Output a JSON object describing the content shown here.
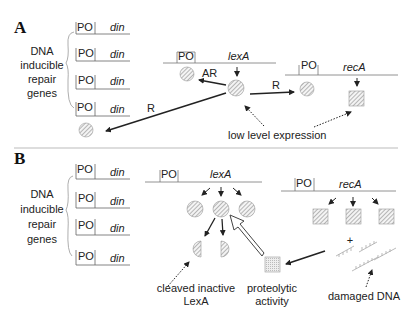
{
  "panel_a": {
    "letter": "A",
    "group_label": [
      "DNA",
      "inducible",
      "repair",
      "genes"
    ],
    "genes": [
      {
        "promoter": "PO",
        "name": "din"
      },
      {
        "promoter": "PO",
        "name": "din"
      },
      {
        "promoter": "PO",
        "name": "din"
      },
      {
        "promoter": "PO",
        "name": "din"
      }
    ],
    "lexA_gene": {
      "promoter": "PO",
      "name": "lexA"
    },
    "recA_gene": {
      "promoter": "PO",
      "name": "recA"
    },
    "autoregulation_label": "AR",
    "repression_label_left": "R",
    "repression_label_right": "R",
    "low_expression_label": "low level expression"
  },
  "panel_b": {
    "letter": "B",
    "group_label": [
      "DNA",
      "inducible",
      "repair",
      "genes"
    ],
    "genes": [
      {
        "promoter": "PO",
        "name": "din"
      },
      {
        "promoter": "PO",
        "name": "din"
      },
      {
        "promoter": "PO",
        "name": "din"
      },
      {
        "promoter": "PO",
        "name": "din"
      }
    ],
    "lexA_gene": {
      "promoter": "PO",
      "name": "lexA"
    },
    "recA_gene": {
      "promoter": "PO",
      "name": "recA"
    },
    "cleaved_label": [
      "cleaved inactive",
      "LexA"
    ],
    "proteolytic_label": [
      "proteolytic",
      "activity"
    ],
    "plus_sign": "+",
    "damaged_dna_label": "damaged DNA"
  }
}
